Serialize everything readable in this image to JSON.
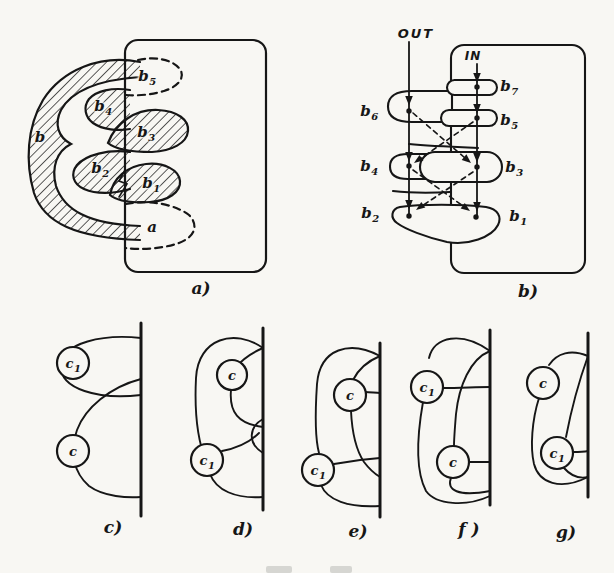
{
  "labels": {
    "a_b": {
      "base": "b",
      "sub": ""
    },
    "a_b5": {
      "base": "b",
      "sub": "5"
    },
    "a_b4": {
      "base": "b",
      "sub": "4"
    },
    "a_b3": {
      "base": "b",
      "sub": "3"
    },
    "a_b2": {
      "base": "b",
      "sub": "2"
    },
    "a_b1": {
      "base": "b",
      "sub": "1"
    },
    "a_a": {
      "base": "a",
      "sub": ""
    },
    "b_out": "OUT",
    "b_in": "IN",
    "b_b7": {
      "base": "b",
      "sub": "7"
    },
    "b_b6": {
      "base": "b",
      "sub": "6"
    },
    "b_b5": {
      "base": "b",
      "sub": "5"
    },
    "b_b4": {
      "base": "b",
      "sub": "4"
    },
    "b_b3": {
      "base": "b",
      "sub": "3"
    },
    "b_b2": {
      "base": "b",
      "sub": "2"
    },
    "b_b1": {
      "base": "b",
      "sub": "1"
    },
    "c_c1": {
      "base": "c",
      "sub": "1"
    },
    "c_c": {
      "base": "c",
      "sub": ""
    },
    "d_c": {
      "base": "c",
      "sub": ""
    },
    "d_c1": {
      "base": "c",
      "sub": "1"
    },
    "e_c": {
      "base": "c",
      "sub": ""
    },
    "e_c1": {
      "base": "c",
      "sub": "1"
    },
    "f_c1": {
      "base": "c",
      "sub": "1"
    },
    "f_c": {
      "base": "c",
      "sub": ""
    },
    "g_c": {
      "base": "c",
      "sub": ""
    },
    "g_c1": {
      "base": "c",
      "sub": "1"
    }
  },
  "captions": {
    "a": "a)",
    "b": "b)",
    "c": "c)",
    "d": "d)",
    "e": "e)",
    "f": "f )",
    "g": "g)"
  },
  "colors": {
    "ink": "#161616",
    "paper": "#f8f7f3"
  }
}
